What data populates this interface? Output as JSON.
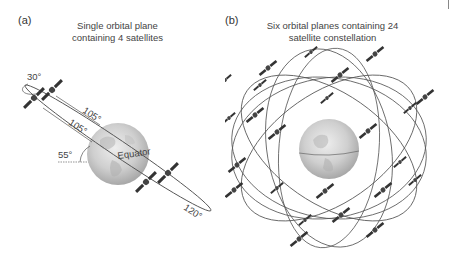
{
  "figure": {
    "panels": [
      {
        "label": "(a)",
        "title_line1": "Single orbital plane",
        "title_line2": "containing 4 satellites",
        "annotations": {
          "separation_angle_small": "30°",
          "separation_angle_1": "105°",
          "separation_angle_2": "105°",
          "separation_angle_3": "120°",
          "inclination_angle": "55°",
          "equator_label": "Equator"
        },
        "satellite_count": 4
      },
      {
        "label": "(b)",
        "title_line1": "Six orbital planes containing 24",
        "title_line2": "satellite constellation",
        "orbital_planes": 6,
        "satellite_count": 24
      }
    ],
    "colors": {
      "orbit_line": "#555555",
      "satellite": "#333333",
      "earth": "#c8c8c8",
      "text": "#444444"
    }
  }
}
